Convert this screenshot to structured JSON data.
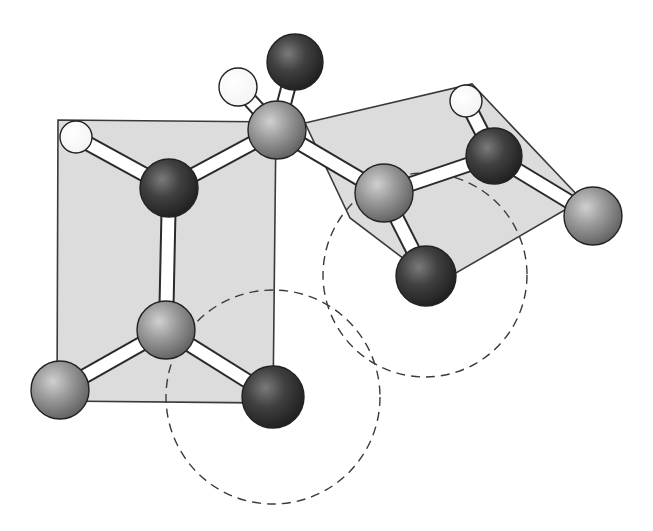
{
  "diagram": {
    "type": "ball-and-stick molecular model",
    "colors": {
      "background": "#ffffff",
      "plane_fill": "#dcdcdc",
      "plane_stroke": "#3a3a3a",
      "hydrogen": "#ffffff",
      "dark_atom": "#3a3a3a",
      "gray_atom": "#8c8c8c",
      "bond": "#ffffff"
    },
    "planes": [
      {
        "name": "left-peptide-plane",
        "points": "58,120 276,122 273,403 57,401"
      },
      {
        "name": "right-peptide-plane",
        "points": "305,123 472,84 582,200 456,273 408,262 350,218"
      }
    ],
    "dashed_circles": [
      {
        "name": "lower-left-circle",
        "cx": 273,
        "cy": 397,
        "r": 107
      },
      {
        "name": "right-circle",
        "cx": 425,
        "cy": 275,
        "r": 102
      }
    ],
    "atoms": [
      {
        "id": "h1",
        "kind": "hydrogen",
        "cx": 76,
        "cy": 137,
        "r": 16
      },
      {
        "id": "n1",
        "kind": "dark",
        "cx": 169,
        "cy": 188,
        "r": 29
      },
      {
        "id": "ca1",
        "kind": "gray",
        "cx": 277,
        "cy": 130,
        "r": 29
      },
      {
        "id": "ha",
        "kind": "hydrogen",
        "cx": 238,
        "cy": 87,
        "r": 19
      },
      {
        "id": "top",
        "kind": "dark",
        "cx": 295,
        "cy": 62,
        "r": 28
      },
      {
        "id": "c2",
        "kind": "gray",
        "cx": 384,
        "cy": 193,
        "r": 29
      },
      {
        "id": "o2",
        "kind": "dark",
        "cx": 426,
        "cy": 276,
        "r": 30
      },
      {
        "id": "n2",
        "kind": "dark",
        "cx": 494,
        "cy": 156,
        "r": 28
      },
      {
        "id": "h2",
        "kind": "hydrogen",
        "cx": 466,
        "cy": 101,
        "r": 16
      },
      {
        "id": "ca2",
        "kind": "gray",
        "cx": 593,
        "cy": 216,
        "r": 29
      },
      {
        "id": "c1",
        "kind": "gray",
        "cx": 166,
        "cy": 330,
        "r": 29
      },
      {
        "id": "left",
        "kind": "gray",
        "cx": 60,
        "cy": 390,
        "r": 29
      },
      {
        "id": "o1",
        "kind": "dark",
        "cx": 273,
        "cy": 397,
        "r": 31
      }
    ],
    "bonds": [
      [
        "h1",
        "n1"
      ],
      [
        "n1",
        "ca1"
      ],
      [
        "n1",
        "c1"
      ],
      [
        "ca1",
        "ha"
      ],
      [
        "ca1",
        "top"
      ],
      [
        "ca1",
        "c2"
      ],
      [
        "c2",
        "o2"
      ],
      [
        "c2",
        "n2"
      ],
      [
        "n2",
        "h2"
      ],
      [
        "n2",
        "ca2"
      ],
      [
        "c1",
        "left"
      ],
      [
        "c1",
        "o1"
      ]
    ]
  }
}
